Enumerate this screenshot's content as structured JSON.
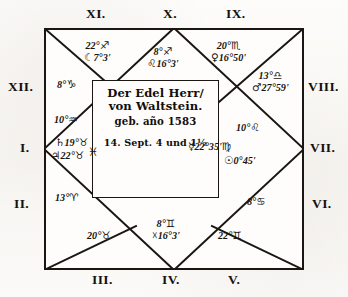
{
  "document": {
    "type": "astrological-birth-chart",
    "form": "square-horoscope",
    "center": {
      "line1": "Der Edel Herr/",
      "line2": "von Waltstein.",
      "line3": "geb. año 1583",
      "line4": "14. Sept. 4 und 1½"
    }
  },
  "house_labels": {
    "h1": "I.",
    "h2": "II.",
    "h3": "III.",
    "h4": "IV.",
    "h5": "V.",
    "h6": "VI.",
    "h7": "VII.",
    "h8": "VIII.",
    "h9": "IX.",
    "h10": "X.",
    "h11": "XI.",
    "h12": "XII."
  },
  "cusps": {
    "h1": {
      "deg": "10°",
      "sign": "♒"
    },
    "h2": {
      "deg": "13°",
      "sign": "♈"
    },
    "h3": {
      "deg": "20°",
      "sign": "♉"
    },
    "h4": {
      "deg": "8°",
      "sign": "♊"
    },
    "h5": {
      "deg": "22°",
      "sign": "♊"
    },
    "h6": {
      "deg": "8°",
      "sign": "♋"
    },
    "h7": {
      "deg": "10°",
      "sign": "♌"
    },
    "h8": {
      "deg": "13°",
      "sign": "♎"
    },
    "h9": {
      "deg": "20°",
      "sign": "♏"
    },
    "h10": {
      "deg": "8°",
      "sign": "♐"
    },
    "h11": {
      "deg": "22°",
      "sign": "♐"
    },
    "h12": {
      "deg": "8°",
      "sign": "♑"
    }
  },
  "planets": {
    "moon": {
      "glyph": "☾",
      "deg": "7°",
      "min": "3'",
      "sign": ""
    },
    "node_head": {
      "glyph": "",
      "deg": "16°",
      "min": "3'",
      "sign": "♌"
    },
    "venus": {
      "glyph": "♀",
      "deg": "16°",
      "min": "50'",
      "sign": ""
    },
    "mars": {
      "glyph": "♂",
      "deg": "27°",
      "min": "59'",
      "sign": ""
    },
    "sun": {
      "glyph": "☉",
      "deg": "0°",
      "min": "45'",
      "sign": ""
    },
    "mercury": {
      "glyph": "☿",
      "deg": "22°",
      "min": "35'",
      "sign": "♍"
    },
    "saturn": {
      "glyph": "♄",
      "deg": "19°",
      "min": "",
      "sign": "♉"
    },
    "jupiter": {
      "glyph": "♃",
      "deg": "22°",
      "min": "",
      "sign": "♉"
    },
    "pisces_mark": {
      "glyph": "♓",
      "deg": "",
      "min": "",
      "sign": ""
    },
    "node_tail": {
      "glyph": "☓",
      "deg": "16°",
      "min": "3'",
      "sign": ""
    }
  }
}
